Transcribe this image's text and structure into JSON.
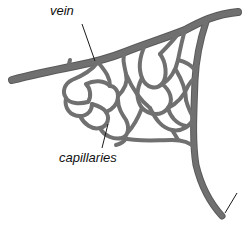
{
  "diagram": {
    "labels": {
      "vein": "vein",
      "capillaries": "capillaries"
    },
    "colors": {
      "vessel": "#707070",
      "vessel_edge": "#5a5a5a",
      "leader_line": "#1a1a1a",
      "background": "#ffffff"
    }
  }
}
